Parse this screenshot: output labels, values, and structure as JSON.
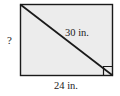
{
  "figure": {
    "shape_type": "rectangle-with-diagonal",
    "fill_color": "#ececec",
    "stroke_color": "#1a1a1a",
    "background_color": "#ffffff",
    "rectangle": {
      "x": 20,
      "y": 4,
      "width": 93,
      "height": 72
    },
    "diagonal": {
      "from": "top-left",
      "to": "bottom-right",
      "x1": 21,
      "y1": 5,
      "x2": 112,
      "y2": 75
    },
    "right_angle_marker": {
      "present": true,
      "corner": "bottom-right",
      "size": 9
    },
    "labels": {
      "height_unknown": "?",
      "hypotenuse": "30 in.",
      "base": "24 in."
    },
    "measurements": [
      {
        "name": "hypotenuse",
        "value": 30,
        "unit": "in."
      },
      {
        "name": "base",
        "value": 24,
        "unit": "in."
      },
      {
        "name": "height",
        "value": "?",
        "unit": ""
      }
    ]
  }
}
